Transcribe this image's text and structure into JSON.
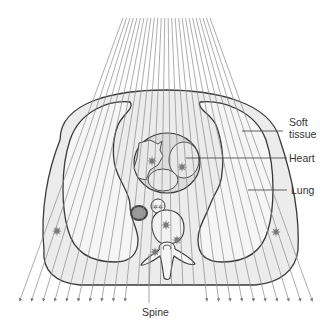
{
  "diagram": {
    "type": "cross-sectional anatomy with radiation beams",
    "labels": {
      "soft_tissue_line1": "Soft",
      "soft_tissue_line2": "tissue",
      "heart": "Heart",
      "lung": "Lung",
      "spine": "Spine"
    },
    "colors": {
      "outline": "#3a3a3a",
      "beam": "#8a8a8a",
      "tissue_fill": "#ececec",
      "lung_fill": "#f6f6f6",
      "heart_fill": "#dcdcdc",
      "star": "#7a7a7a",
      "vessel_dark": "#555555",
      "vessel_inner": "#9a9a9a"
    },
    "beams": {
      "count": 26,
      "top_y": 18,
      "top_x_start": 123,
      "top_x_end": 210,
      "bottom_y": 300,
      "bottom_x_start": 20,
      "bottom_x_end": 312
    },
    "interaction_markers": [
      {
        "name": "heart-star-left",
        "x": 152,
        "y": 161
      },
      {
        "name": "heart-star-right",
        "x": 182,
        "y": 167
      },
      {
        "name": "lung-left-star",
        "x": 57,
        "y": 231
      },
      {
        "name": "lung-right-star",
        "x": 276,
        "y": 232
      },
      {
        "name": "aorta-star",
        "x": 166,
        "y": 225
      },
      {
        "name": "spine-star-upper",
        "x": 177,
        "y": 240
      },
      {
        "name": "spine-star-lower",
        "x": 155,
        "y": 252
      }
    ]
  }
}
